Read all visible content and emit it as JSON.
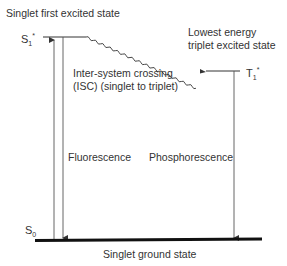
{
  "diagram": {
    "type": "jablonski-energy-level-diagram",
    "states": {
      "s1": {
        "symbol": "S",
        "subscript": "1",
        "superscript": "*",
        "description": "Singlet first excited state"
      },
      "t1": {
        "symbol": "T",
        "subscript": "1",
        "superscript": "*",
        "description_line1": "Lowest energy",
        "description_line2": "triplet excited state"
      },
      "s0": {
        "symbol": "S",
        "subscript": "0",
        "description": "Singlet ground state"
      }
    },
    "transitions": {
      "isc_line1": "Inter-system crossing",
      "isc_line2": "(ISC) (singlet to triplet)",
      "fluorescence": "Fluorescence",
      "phosphorescence": "Phosphorescence"
    },
    "colors": {
      "line": "#333333",
      "ground": "#111111"
    }
  }
}
